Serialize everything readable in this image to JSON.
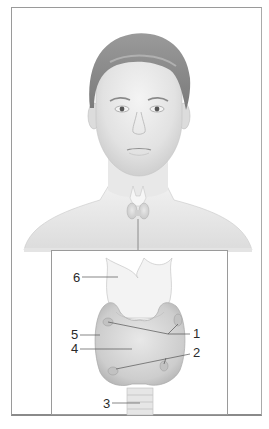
{
  "figure": {
    "overview": "Frontal view of male head and shoulders showing thyroid location in neck",
    "inset_description": "Enlarged anterior view of thyroid gland with larynx and trachea"
  },
  "labels": [
    {
      "id": "1",
      "text": "1"
    },
    {
      "id": "2",
      "text": "2"
    },
    {
      "id": "3",
      "text": "3"
    },
    {
      "id": "4",
      "text": "4"
    },
    {
      "id": "5",
      "text": "5"
    },
    {
      "id": "6",
      "text": "6"
    }
  ],
  "colors": {
    "frame": "#9a9a9a",
    "skin": "#e6e6e6",
    "hair": "#8c8c8c",
    "gland": "#d4d4d4",
    "cartilage": "#efefef",
    "leader": "#555555"
  }
}
